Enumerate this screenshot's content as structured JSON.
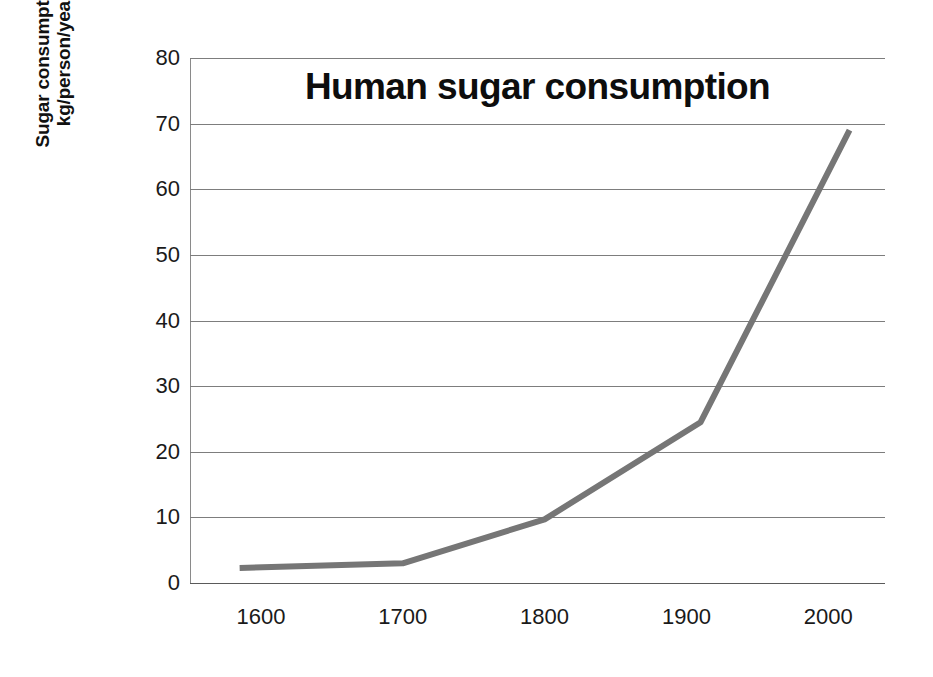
{
  "chart_data": {
    "type": "line",
    "title": "Human sugar consumption",
    "xlabel": "",
    "ylabel_lines": [
      "Sugar consumption",
      "kg/person/year"
    ],
    "ylabel": "Sugar consumption kg/person/year",
    "xlim": [
      1550,
      2040
    ],
    "ylim": [
      0,
      80
    ],
    "ytick_labels": [
      "80",
      "70",
      "60",
      "50",
      "40",
      "30",
      "20",
      "10",
      "0"
    ],
    "ytick_values": [
      80,
      70,
      60,
      50,
      40,
      30,
      20,
      10,
      0
    ],
    "xtick_labels": [
      "1600",
      "1700",
      "1800",
      "1900",
      "2000"
    ],
    "xtick_values": [
      1600,
      1700,
      1800,
      1900,
      2000
    ],
    "grid": "horizontal",
    "legend": "none",
    "series": [
      {
        "name": "Sugar consumption",
        "color": "#767676",
        "line_width": 6,
        "x": [
          1585,
          1700,
          1800,
          1910,
          2015
        ],
        "values": [
          2.3,
          3.0,
          9.7,
          24.5,
          69.0
        ]
      }
    ]
  },
  "colors": {
    "line": "#767676",
    "gridline": "#7d7d7d",
    "axis": "#5a5a5a",
    "text": "#1a1a1a",
    "background": "#ffffff"
  }
}
